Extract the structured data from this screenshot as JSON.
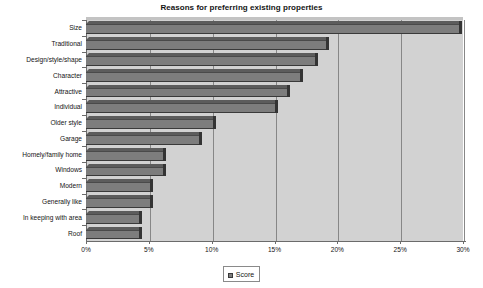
{
  "chart_data": {
    "type": "bar",
    "orientation": "horizontal",
    "title": "Reasons for preferring existing properties",
    "xlabel": "",
    "ylabel": "",
    "xlim": [
      0,
      30
    ],
    "xtick_labels": [
      "0%",
      "5%",
      "10%",
      "15%",
      "20%",
      "25%",
      "30%"
    ],
    "xticks": [
      0,
      5,
      10,
      15,
      20,
      25,
      30
    ],
    "grid": true,
    "legend_position": "bottom",
    "legend": [
      "Score"
    ],
    "categories": [
      "Roof",
      "In keeping with area",
      "Generally like",
      "Modern",
      "Windows",
      "Homely/family home",
      "Garage",
      "Older style",
      "Individual",
      "Attractive",
      "Character",
      "Design/style/shape",
      "Traditional",
      "Size"
    ],
    "series": [
      {
        "name": "Score",
        "values": [
          4.2,
          4.2,
          5.1,
          5.1,
          6.1,
          6.1,
          9.0,
          10.1,
          15.0,
          16.0,
          17.0,
          18.2,
          19.1,
          29.7
        ]
      }
    ],
    "colors": {
      "bar_face": "#7d7d7d",
      "bar_top": "#5c5c5c",
      "bar_cap": "#343434",
      "plot_background": "#d2d2d2",
      "gridline": "#878787",
      "axis": "#6b6b6b",
      "text": "#141414",
      "page_background": "#ffffff"
    }
  }
}
